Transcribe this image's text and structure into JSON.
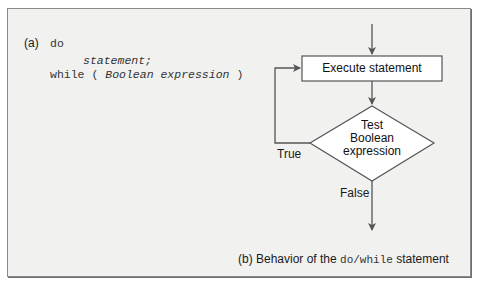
{
  "part_a": {
    "label": "(a)",
    "code_line1_keyword": "do",
    "code_line2": "statement;",
    "code_line3_keyword": "while",
    "code_line3_open": "(",
    "code_line3_expr": "Boolean expression",
    "code_line3_close": ")"
  },
  "part_b": {
    "process_box": "Execute statement",
    "decision_line1": "Test",
    "decision_line2": "Boolean",
    "decision_line3": "expression",
    "true_label": "True",
    "false_label": "False",
    "caption_prefix": "(b) Behavior of the",
    "caption_code": "do/while",
    "caption_suffix": "statement"
  },
  "colors": {
    "panel_bg": "#f1f1f0",
    "border": "#8a8a8a",
    "line": "#555555",
    "shape_fill": "#ffffff"
  }
}
